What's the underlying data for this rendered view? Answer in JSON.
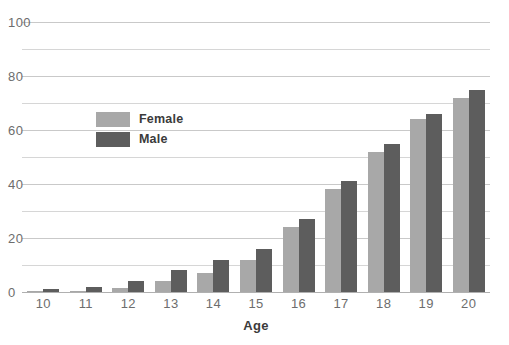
{
  "chart_data": {
    "type": "bar",
    "title": "",
    "subtitle": "",
    "xlabel": "Age",
    "ylabel": "",
    "categories": [
      "10",
      "11",
      "12",
      "13",
      "14",
      "15",
      "16",
      "17",
      "18",
      "19",
      "20"
    ],
    "series": [
      {
        "name": "Female",
        "color": "#a8a8a8",
        "values": [
          0.3,
          0.5,
          1.5,
          4,
          7,
          12,
          24,
          38,
          52,
          64,
          72
        ]
      },
      {
        "name": "Male",
        "color": "#5d5d5d",
        "values": [
          1,
          2,
          4,
          8,
          12,
          16,
          27,
          41,
          55,
          66,
          75
        ]
      }
    ],
    "ylim": [
      0,
      100
    ],
    "ytick_labels": [
      "0",
      "20",
      "40",
      "60",
      "80",
      "100"
    ],
    "ytick_values": [
      0,
      20,
      40,
      60,
      80,
      100
    ],
    "gridline_values": [
      0,
      10,
      20,
      30,
      40,
      50,
      60,
      70,
      80,
      90,
      100
    ],
    "grid": true,
    "legend_position": "inside-upper-left",
    "legend": [
      "Female",
      "Male"
    ],
    "annotations": []
  },
  "axis": {
    "x_title": "Age"
  }
}
